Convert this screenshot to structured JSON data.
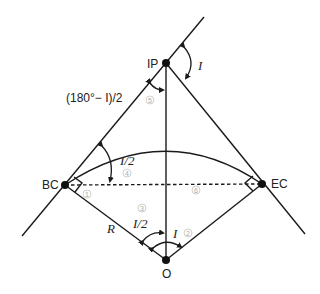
{
  "diagram": {
    "points": {
      "IP": {
        "label": "IP",
        "x": 166,
        "y": 63
      },
      "BC": {
        "label": "BC",
        "x": 65,
        "y": 185
      },
      "EC": {
        "label": "EC",
        "x": 262,
        "y": 184
      },
      "O": {
        "label": "O",
        "x": 166,
        "y": 260
      }
    },
    "angle_labels": {
      "I_top": "I",
      "half_I_BC": "I/2",
      "half_I_O": "I/2",
      "I_O": "I",
      "radius": "R",
      "ip_angle": "(180°− I)/2"
    },
    "circled_numbers": [
      "1",
      "2",
      "3",
      "4",
      "5",
      "6"
    ],
    "colors": {
      "line": "#1a1a1a",
      "circled": "#aaaaaa",
      "background": "#ffffff"
    }
  }
}
